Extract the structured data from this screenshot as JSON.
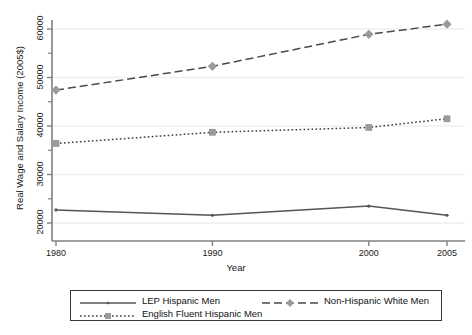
{
  "chart_data": {
    "type": "line",
    "title": "",
    "xlabel": "Year",
    "ylabel": "Real Wage and Salary Income (2005$)",
    "x": [
      1980,
      1990,
      2000,
      2005
    ],
    "xticklabels": [
      "1980",
      "1990",
      "2000",
      "2005"
    ],
    "yticklabels": [
      "20000",
      "30000",
      "40000",
      "50000",
      "60000"
    ],
    "yticks": [
      20000,
      30000,
      40000,
      50000,
      60000
    ],
    "xlim": [
      1978,
      2006.5
    ],
    "ylim": [
      18500,
      63500
    ],
    "grid": "horizontal",
    "legend_position": "bottom",
    "series": [
      {
        "name": "LEP Hispanic Men",
        "values": [
          22700,
          21600,
          23500,
          21600
        ],
        "marker": "circle",
        "linestyle": "solid",
        "color": "#555555"
      },
      {
        "name": "Non-Hispanic White Men",
        "values": [
          47400,
          52300,
          58900,
          61000
        ],
        "marker": "diamond",
        "linestyle": "dashed",
        "color": "#8a8a8a"
      },
      {
        "name": "English Fluent Hispanic Men",
        "values": [
          36400,
          38700,
          39700,
          41500
        ],
        "marker": "square",
        "linestyle": "dotted",
        "color": "#8a8a8a"
      }
    ]
  },
  "colors": {
    "axis": "#808080",
    "grid": "#efefef",
    "line_solid": "#555555",
    "line_dashed": "#4a4a4a",
    "line_dotted": "#3a3a3a",
    "marker_gray": "#9a9a9a",
    "marker_dark": "#555555",
    "legend_border": "#3a3a3a",
    "text": "#1a1a1a"
  }
}
